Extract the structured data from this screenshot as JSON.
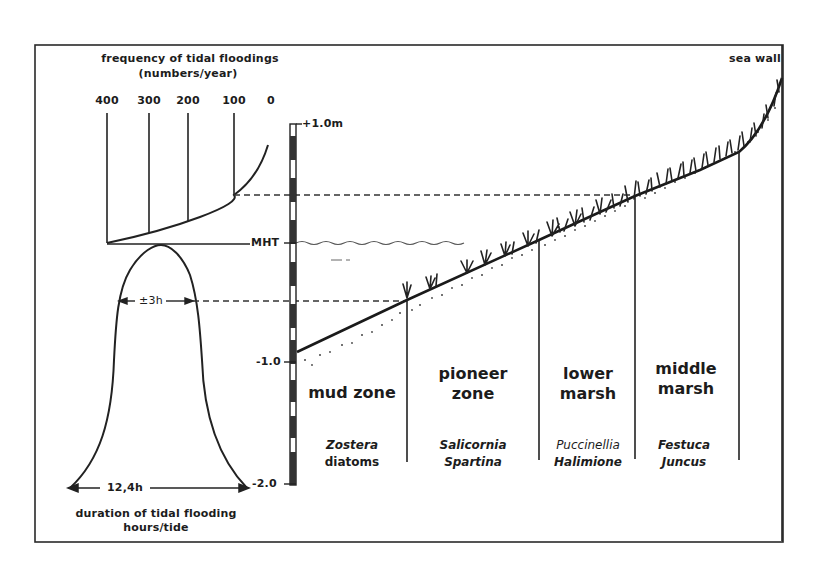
{
  "diagram": {
    "frequency_axis": {
      "title_line1": "frequency of tidal floodings",
      "title_line2": "(numbers/year)",
      "ticks": [
        "400",
        "300",
        "200",
        "100",
        "0"
      ]
    },
    "duration_axis": {
      "span_label": "12,4h",
      "inner_span_label": "±3h",
      "title_line1": "duration of tidal flooding",
      "title_line2": "hours/tide"
    },
    "height_gauge": {
      "top_label": "+1.0m",
      "mht_label": "MHT",
      "mid_label": "-1.0",
      "bottom_label": "-2.0"
    },
    "sea_wall_label": "sea wall",
    "zones": [
      {
        "name_line1": "mud zone",
        "name_line2": "",
        "species_line1": "Zostera",
        "species_line2": "diatoms"
      },
      {
        "name_line1": "pioneer",
        "name_line2": "zone",
        "species_line1": "Salicornia",
        "species_line2": "Spartina"
      },
      {
        "name_line1": "lower",
        "name_line2": "marsh",
        "species_line1": "Puccinellia",
        "species_line2": "Halimione"
      },
      {
        "name_line1": "middle",
        "name_line2": "marsh",
        "species_line1": "Festuca",
        "species_line2": "Juncus"
      }
    ]
  }
}
